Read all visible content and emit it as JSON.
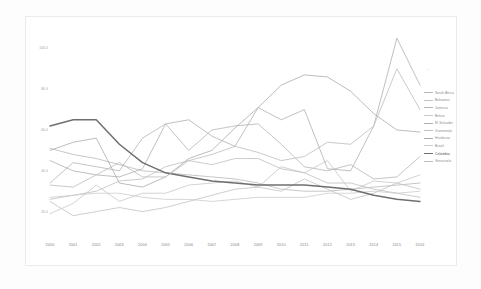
{
  "chart_data": {
    "type": "line",
    "title": "",
    "xlabel": "",
    "ylabel": "Homicides per 100,000 inhabitants",
    "x": [
      2000,
      2001,
      2002,
      2003,
      2004,
      2005,
      2006,
      2007,
      2008,
      2009,
      2010,
      2011,
      2012,
      2013,
      2014,
      2015,
      2016
    ],
    "xlim": [
      2000,
      2016
    ],
    "ylim": [
      10,
      110
    ],
    "yticks": [
      100.0,
      80.0,
      60.0,
      40.0,
      20.0
    ],
    "ytick_labels": [
      "100.0",
      "80.0",
      "60.0",
      "40.0",
      "20.0"
    ],
    "grid": false,
    "legend_position": "right",
    "series": [
      {
        "name": "South Africa",
        "color": "#b9b9b9",
        "values": [
          51.0,
          48.0,
          46.0,
          43.0,
          40.0,
          39.0,
          38.0,
          37.0,
          36.0,
          34.0,
          31.0,
          30.0,
          30.0,
          31.0,
          32.0,
          33.0,
          34.0
        ]
      },
      {
        "name": "Bahamas",
        "color": "#c2c2c2",
        "values": [
          25.0,
          18.0,
          20.0,
          22.0,
          20.0,
          22.0,
          25.0,
          28.0,
          31.0,
          32.0,
          30.0,
          36.0,
          31.0,
          26.0,
          29.0,
          34.0,
          31.0
        ]
      },
      {
        "name": "Jamaica",
        "color": "#b5b5b5",
        "values": [
          34.0,
          44.0,
          42.0,
          40.0,
          56.0,
          63.0,
          50.0,
          60.0,
          62.0,
          63.0,
          53.0,
          42.0,
          40.0,
          43.0,
          36.0,
          37.0,
          47.0
        ]
      },
      {
        "name": "Belize",
        "color": "#c8c8c8",
        "values": [
          19.0,
          24.0,
          33.0,
          25.0,
          29.0,
          29.0,
          33.0,
          34.0,
          35.0,
          32.0,
          42.0,
          39.0,
          45.0,
          30.0,
          35.0,
          34.0,
          38.0
        ]
      },
      {
        "name": "El Salvador",
        "color": "#b0b0b0",
        "values": [
          45.0,
          40.0,
          38.0,
          37.0,
          41.0,
          63.0,
          65.0,
          57.0,
          52.0,
          71.0,
          65.0,
          70.0,
          41.0,
          40.0,
          62.0,
          105.0,
          82.0
        ]
      },
      {
        "name": "Guatemala",
        "color": "#bfbfbf",
        "values": [
          26.0,
          28.0,
          30.0,
          35.0,
          36.0,
          42.0,
          45.0,
          43.0,
          46.0,
          46.0,
          41.0,
          39.0,
          34.0,
          34.0,
          31.0,
          29.0,
          27.0
        ]
      },
      {
        "name": "Honduras",
        "color": "#ababab",
        "values": [
          50.0,
          54.0,
          56.0,
          34.0,
          32.0,
          37.0,
          46.0,
          50.0,
          61.0,
          71.0,
          82.0,
          87.0,
          86.0,
          79.0,
          68.0,
          60.0,
          59.0
        ]
      },
      {
        "name": "Brazil",
        "color": "#cccccc",
        "values": [
          27.0,
          28.0,
          29.0,
          29.0,
          27.0,
          26.0,
          26.0,
          25.0,
          26.0,
          27.0,
          27.0,
          27.0,
          29.0,
          29.0,
          30.0,
          29.0,
          30.0
        ]
      },
      {
        "name": "Colombia",
        "color": "#6f6f6f",
        "values": [
          62.0,
          65.0,
          65.0,
          53.0,
          44.0,
          39.0,
          37.0,
          35.0,
          34.0,
          33.0,
          33.0,
          33.0,
          32.0,
          31.0,
          28.0,
          26.0,
          25.0
        ]
      },
      {
        "name": "Venezuela",
        "color": "#bdbdbd",
        "values": [
          33.0,
          32.0,
          38.0,
          44.0,
          37.0,
          37.0,
          45.0,
          48.0,
          52.0,
          49.0,
          45.0,
          47.0,
          54.0,
          53.0,
          62.0,
          90.0,
          70.0
        ]
      }
    ]
  },
  "legend": {
    "items": [
      {
        "label": "South Africa"
      },
      {
        "label": "Bahamas"
      },
      {
        "label": "Jamaica"
      },
      {
        "label": "Belize"
      },
      {
        "label": "El Salvador"
      },
      {
        "label": "Guatemala"
      },
      {
        "label": "Honduras"
      },
      {
        "label": "Brazil"
      },
      {
        "label": "Colombia"
      },
      {
        "label": "Venezuela"
      }
    ]
  }
}
